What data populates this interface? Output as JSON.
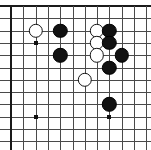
{
  "diagram": {
    "kind": "go-board-diagram",
    "board": {
      "visible_columns": 12,
      "visible_rows": 11,
      "origin_x": 11,
      "origin_y": 6,
      "spacing": 12.3,
      "line_color": "#4a4a4a",
      "edge_color": "#1a1a1a",
      "background_color": "#ffffff",
      "edges": [
        "top",
        "left",
        "right"
      ],
      "cropped_edges": [
        "bottom"
      ]
    },
    "star_points": [
      {
        "name": "star-upper-left",
        "col": 2,
        "row": 3
      },
      {
        "name": "star-lower-left",
        "col": 2,
        "row": 9
      },
      {
        "name": "star-lower-right",
        "col": 8,
        "row": 9
      }
    ],
    "stones": [
      {
        "id": "w1",
        "color": "white",
        "col": 2,
        "row": 2,
        "label": "white stone upper left"
      },
      {
        "id": "b1",
        "color": "black",
        "col": 4,
        "row": 2,
        "label": "black stone upper left"
      },
      {
        "id": "b2",
        "color": "black",
        "col": 4,
        "row": 4,
        "label": "black stone left middle"
      },
      {
        "id": "w2",
        "color": "white",
        "col": 7,
        "row": 2,
        "label": "white stone upper right"
      },
      {
        "id": "b3",
        "color": "black",
        "col": 8,
        "row": 2,
        "label": "black stone upper right"
      },
      {
        "id": "w3",
        "color": "white",
        "col": 7,
        "row": 3,
        "label": "white stone right cluster"
      },
      {
        "id": "b4",
        "color": "black",
        "col": 8,
        "row": 3,
        "label": "black stone right cluster"
      },
      {
        "id": "w4",
        "color": "white",
        "col": 7,
        "row": 4,
        "label": "white stone right cluster lower"
      },
      {
        "id": "b5",
        "color": "black",
        "col": 9,
        "row": 4,
        "label": "black stone far right"
      },
      {
        "id": "b6",
        "color": "black",
        "col": 8,
        "row": 5,
        "label": "black stone below cluster"
      },
      {
        "id": "w5",
        "color": "white",
        "col": 6,
        "row": 6,
        "label": "white stone center"
      },
      {
        "id": "b7",
        "color": "black",
        "col": 8,
        "row": 8,
        "label": "black stone lower right"
      }
    ],
    "colors": {
      "black_stone": "#111111",
      "white_stone": "#ffffff",
      "white_stone_outline": "#141414",
      "grid": "#4a4a4a",
      "border": "#1a1a1a"
    },
    "stone_radius": 7.2
  }
}
